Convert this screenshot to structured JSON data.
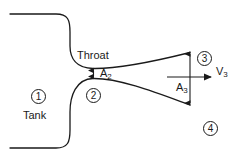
{
  "diagram": {
    "labels": {
      "throat": "Throat",
      "tank": "Tank",
      "area_throat": "A",
      "area_throat_sub": "2",
      "area_exit": "A",
      "area_exit_sub": "3",
      "velocity_exit": "V",
      "velocity_exit_sub": "3"
    },
    "stations": [
      {
        "id": "1",
        "label": "1",
        "region": "tank"
      },
      {
        "id": "2",
        "label": "2",
        "region": "throat"
      },
      {
        "id": "3",
        "label": "3",
        "region": "exit-plane"
      },
      {
        "id": "4",
        "label": "4",
        "region": "ambient"
      }
    ],
    "colors": {
      "line": "#1a1a1a",
      "background": "#ffffff",
      "text": "#1a1a1a"
    }
  }
}
